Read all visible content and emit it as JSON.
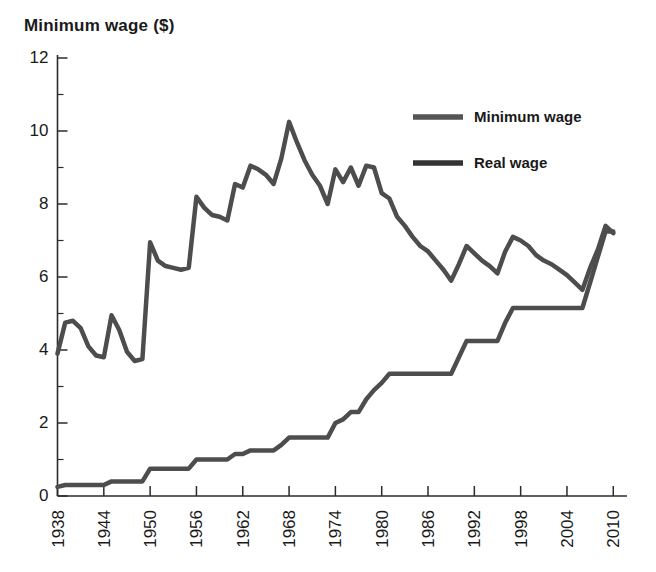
{
  "chart_data": {
    "type": "line",
    "title": "Minimum wage ($)",
    "xlabel": "",
    "ylabel": "Minimum wage ($)",
    "xlim": [
      1938,
      2011
    ],
    "ylim": [
      0,
      12
    ],
    "grid": false,
    "legend_position": "upper-right",
    "xticks": [
      1938,
      1944,
      1950,
      1956,
      1962,
      1968,
      1974,
      1980,
      1986,
      1992,
      1998,
      2004,
      2010
    ],
    "xtick_labels": [
      "1938",
      "1944",
      "1950",
      "1956",
      "1962",
      "1968",
      "1974",
      "1980",
      "1986",
      "1992",
      "1998",
      "2004",
      "2010"
    ],
    "yticks": [
      0,
      2,
      4,
      6,
      8,
      10,
      12
    ],
    "ytick_labels": [
      "0",
      "2",
      "4",
      "6",
      "8",
      "10",
      "12"
    ],
    "yticks_minor": [
      1,
      3,
      5,
      7,
      9,
      11
    ],
    "x": [
      1938,
      1939,
      1940,
      1941,
      1942,
      1943,
      1944,
      1945,
      1946,
      1947,
      1948,
      1949,
      1950,
      1951,
      1952,
      1953,
      1954,
      1955,
      1956,
      1957,
      1958,
      1959,
      1960,
      1961,
      1962,
      1963,
      1964,
      1965,
      1966,
      1967,
      1968,
      1969,
      1970,
      1971,
      1972,
      1973,
      1974,
      1975,
      1976,
      1977,
      1978,
      1979,
      1980,
      1981,
      1982,
      1983,
      1984,
      1985,
      1986,
      1987,
      1988,
      1989,
      1990,
      1991,
      1992,
      1993,
      1994,
      1995,
      1996,
      1997,
      1998,
      1999,
      2000,
      2001,
      2002,
      2003,
      2004,
      2005,
      2006,
      2007,
      2008,
      2009,
      2010
    ],
    "series": [
      {
        "name": "Minimum wage",
        "color": "#4d4d4d",
        "linewidth": 4.5,
        "values": [
          0.25,
          0.3,
          0.3,
          0.3,
          0.3,
          0.3,
          0.3,
          0.4,
          0.4,
          0.4,
          0.4,
          0.4,
          0.75,
          0.75,
          0.75,
          0.75,
          0.75,
          0.75,
          1.0,
          1.0,
          1.0,
          1.0,
          1.0,
          1.15,
          1.15,
          1.25,
          1.25,
          1.25,
          1.25,
          1.4,
          1.6,
          1.6,
          1.6,
          1.6,
          1.6,
          1.6,
          2.0,
          2.1,
          2.3,
          2.3,
          2.65,
          2.9,
          3.1,
          3.35,
          3.35,
          3.35,
          3.35,
          3.35,
          3.35,
          3.35,
          3.35,
          3.35,
          3.8,
          4.25,
          4.25,
          4.25,
          4.25,
          4.25,
          4.75,
          5.15,
          5.15,
          5.15,
          5.15,
          5.15,
          5.15,
          5.15,
          5.15,
          5.15,
          5.15,
          5.85,
          6.55,
          7.25,
          7.25
        ]
      },
      {
        "name": "Real wage",
        "color": "#4d4d4d",
        "linewidth": 4.5,
        "values": [
          3.9,
          4.75,
          4.8,
          4.6,
          4.1,
          3.85,
          3.8,
          4.95,
          4.55,
          3.95,
          3.7,
          3.75,
          6.95,
          6.45,
          6.3,
          6.25,
          6.2,
          6.25,
          8.2,
          7.9,
          7.7,
          7.65,
          7.55,
          8.55,
          8.45,
          9.05,
          8.95,
          8.8,
          8.55,
          9.25,
          10.25,
          9.7,
          9.2,
          8.8,
          8.5,
          8.0,
          8.95,
          8.6,
          9.0,
          8.5,
          9.05,
          9.0,
          8.3,
          8.15,
          7.65,
          7.4,
          7.1,
          6.85,
          6.7,
          6.45,
          6.2,
          5.9,
          6.35,
          6.85,
          6.65,
          6.45,
          6.3,
          6.1,
          6.7,
          7.1,
          7.0,
          6.85,
          6.6,
          6.45,
          6.35,
          6.2,
          6.05,
          5.85,
          5.65,
          6.25,
          6.75,
          7.4,
          7.2
        ]
      }
    ]
  },
  "legend": {
    "entries": [
      {
        "label": "Minimum wage",
        "swatch_color": "#555555"
      },
      {
        "label": "Real wage",
        "swatch_color": "#333333"
      }
    ]
  }
}
